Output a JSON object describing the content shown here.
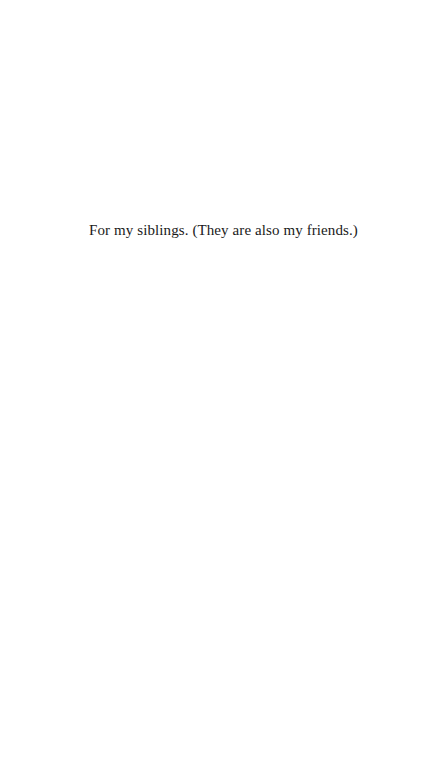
{
  "page": {
    "dedication": "For my siblings. (They are also my friends.)"
  },
  "colors": {
    "background": "#ffffff",
    "text": "#1a1a1a"
  }
}
